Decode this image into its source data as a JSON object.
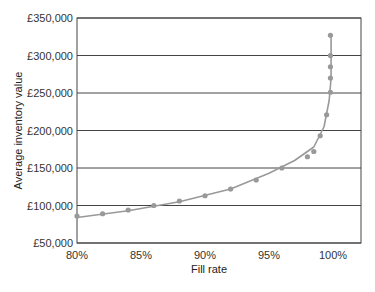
{
  "chart_data": {
    "type": "line",
    "title": "",
    "xlabel": "Fill rate",
    "ylabel": "Average inventory value",
    "x_ticks": [
      "80%",
      "85%",
      "90%",
      "95%",
      "100%"
    ],
    "y_ticks": [
      "£50,000",
      "£100,000",
      "£150,000",
      "£200,000",
      "£250,000",
      "£300,000",
      "£350,000"
    ],
    "xlim": [
      80,
      100
    ],
    "ylim": [
      50000,
      350000
    ],
    "grid": "horizontal",
    "series": [
      {
        "name": "observed",
        "marker": "dot",
        "x": [
          80,
          82,
          84,
          86,
          88,
          90,
          92,
          94,
          96,
          98,
          98.5,
          99,
          99.5,
          99.8,
          99.8,
          99.8,
          99.8,
          99.8
        ],
        "y": [
          86000,
          89000,
          94000,
          100000,
          106000,
          113000,
          122000,
          134000,
          150000,
          165000,
          172000,
          193000,
          221000,
          251000,
          270000,
          285000,
          300000,
          327000
        ]
      }
    ],
    "caption": "Figure 5.? Fill rate vs inventory"
  }
}
